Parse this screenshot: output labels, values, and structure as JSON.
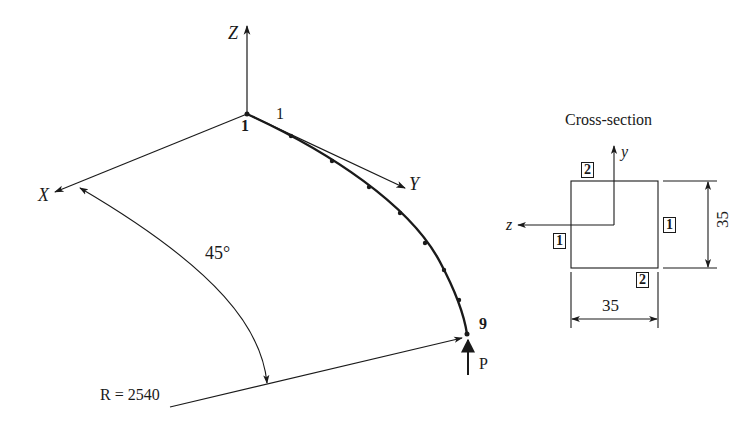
{
  "figure": {
    "type": "curved-beam-structural-model",
    "axes": {
      "z_label": "Z",
      "x_label": "X",
      "y_label": "Y"
    },
    "beam": {
      "start_node_label": "1",
      "end_node_label": "9",
      "element_label": "1",
      "node_count": 9,
      "radius_label": "R = 2540",
      "angle_label": "45°"
    },
    "load": {
      "label": "P"
    },
    "cross_section": {
      "title": "Cross-section",
      "local_y_label": "y",
      "local_z_label": "z",
      "width_label": "35",
      "height_label": "35",
      "point_labels": {
        "top": "2",
        "bottom": "2",
        "left": "1",
        "right": "1"
      }
    },
    "colors": {
      "line": "#1a1a1a",
      "background": "#ffffff"
    }
  }
}
